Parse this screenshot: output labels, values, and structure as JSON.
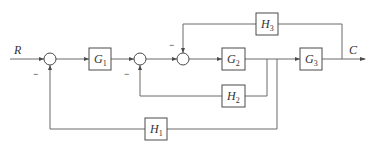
{
  "diagram": {
    "type": "control-system block diagram",
    "input_label": "R",
    "output_label": "C",
    "blocks": [
      {
        "id": "G1",
        "main": "G",
        "sub": "1"
      },
      {
        "id": "G2",
        "main": "G",
        "sub": "2"
      },
      {
        "id": "G3",
        "main": "G",
        "sub": "3"
      },
      {
        "id": "H1",
        "main": "H",
        "sub": "1"
      },
      {
        "id": "H2",
        "main": "H",
        "sub": "2"
      },
      {
        "id": "H3",
        "main": "H",
        "sub": "3"
      }
    ],
    "summing_junctions": [
      {
        "id": "S1",
        "feedback_sign": "−"
      },
      {
        "id": "S2",
        "feedback_sign": "−"
      },
      {
        "id": "S3",
        "feedback_sign": "−"
      }
    ],
    "connections": [
      "R → S1",
      "S1 → G1",
      "G1 → S2",
      "S2 → S3",
      "S3 → G2",
      "G2 → G3",
      "G3 → C",
      "C → H3 → S3 (−)",
      "G2 out → H2 → S2 (−)",
      "G2 out → H1 → S1 (−)"
    ]
  }
}
